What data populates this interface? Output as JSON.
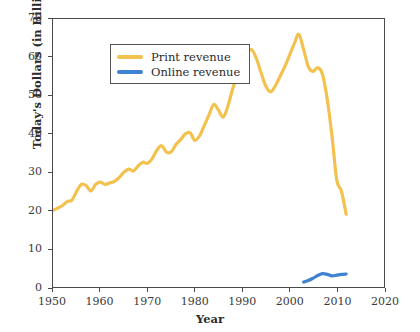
{
  "chart_data": {
    "type": "line",
    "title": "",
    "xlabel": "Year",
    "ylabel": "Today's Dollars (in Billions)",
    "xlim": [
      1950,
      2020
    ],
    "ylim": [
      0,
      70
    ],
    "xticks": [
      1950,
      1960,
      1970,
      1980,
      1990,
      2000,
      2010,
      2020
    ],
    "yticks": [
      0,
      10,
      20,
      30,
      40,
      50,
      60,
      70
    ],
    "grid": false,
    "legend_position": "upper left",
    "series": [
      {
        "name": "Print revenue",
        "color": "#F2C14E",
        "x": [
          1950,
          1951,
          1952,
          1953,
          1954,
          1955,
          1956,
          1957,
          1958,
          1959,
          1960,
          1961,
          1962,
          1963,
          1964,
          1965,
          1966,
          1967,
          1968,
          1969,
          1970,
          1971,
          1972,
          1973,
          1974,
          1975,
          1976,
          1977,
          1978,
          1979,
          1980,
          1981,
          1982,
          1983,
          1984,
          1985,
          1986,
          1987,
          1988,
          1989,
          1990,
          1991,
          1992,
          1993,
          1994,
          1995,
          1996,
          1997,
          1998,
          1999,
          2000,
          2001,
          2002,
          2003,
          2004,
          2005,
          2006,
          2007,
          2008,
          2009,
          2010,
          2011,
          2012
        ],
        "y": [
          20.0,
          20.6,
          21.3,
          22.3,
          22.7,
          25.0,
          26.8,
          26.5,
          25.1,
          26.8,
          27.4,
          26.8,
          27.2,
          27.6,
          28.6,
          30.0,
          30.8,
          30.3,
          31.6,
          32.6,
          32.3,
          33.6,
          35.8,
          36.9,
          35.2,
          35.3,
          37.2,
          38.5,
          40.0,
          40.3,
          38.3,
          39.5,
          42.2,
          45.0,
          47.7,
          46.2,
          44.4,
          47.3,
          51.8,
          55.3,
          58.5,
          61.0,
          62.0,
          59.7,
          56.0,
          52.5,
          51.0,
          52.5,
          55.0,
          57.5,
          60.5,
          63.5,
          66.0,
          62.0,
          57.5,
          56.3,
          57.3,
          55.5,
          49.0,
          39.5,
          28.0,
          25.0,
          19.0
        ]
      },
      {
        "name": "Online revenue",
        "color": "#3F82D1",
        "x": [
          2003,
          2004,
          2005,
          2006,
          2007,
          2008,
          2009,
          2010,
          2011,
          2012
        ],
        "y": [
          1.3,
          1.7,
          2.3,
          3.0,
          3.5,
          3.3,
          2.9,
          3.1,
          3.3,
          3.4
        ]
      }
    ]
  },
  "legend": {
    "items": [
      {
        "label": "Print revenue",
        "color": "#F2C14E"
      },
      {
        "label": "Online revenue",
        "color": "#3F82D1"
      }
    ]
  },
  "axes": {
    "x_title": "Year",
    "y_title": "Today's Dollars (in Billions)",
    "x_tick_labels": [
      "1950",
      "1960",
      "1970",
      "1980",
      "1990",
      "2000",
      "2010",
      "2020"
    ],
    "y_tick_labels": [
      "0",
      "10",
      "20",
      "30",
      "40",
      "50",
      "60",
      "70"
    ]
  },
  "colors": {
    "print": "#F2C14E",
    "online": "#3F82D1",
    "axis": "#4a4a4a",
    "text": "#2b2b2b",
    "background": "#ffffff"
  }
}
